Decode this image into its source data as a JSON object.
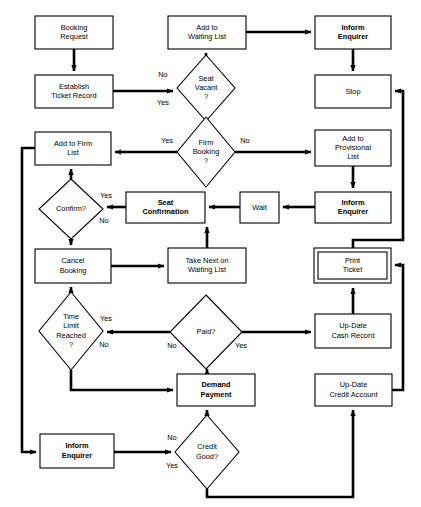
{
  "diagram": {
    "colors": {
      "stroke": "#000000",
      "fill": "#ffffff",
      "text": "#000000"
    },
    "nodes": [
      {
        "id": "booking-request",
        "shape": "process",
        "bold": false,
        "lines": [
          "Booking",
          "Request"
        ],
        "x": 35,
        "y": 16,
        "w": 78,
        "h": 33
      },
      {
        "id": "establish-ticket",
        "shape": "process",
        "bold": false,
        "lines": [
          "Establish",
          "Ticket Record"
        ],
        "x": 35,
        "y": 75,
        "w": 78,
        "h": 33
      },
      {
        "id": "add-waiting-list",
        "shape": "process",
        "bold": false,
        "lines": [
          "Add to",
          "Waiting List"
        ],
        "x": 168,
        "y": 16,
        "w": 78,
        "h": 33
      },
      {
        "id": "inform-enquirer-top",
        "shape": "process",
        "bold": true,
        "lines": [
          "Inform",
          "Enquirer"
        ],
        "x": 315,
        "y": 16,
        "w": 76,
        "h": 33
      },
      {
        "id": "stop",
        "shape": "process",
        "bold": false,
        "lines": [
          "Stop"
        ],
        "x": 315,
        "y": 75,
        "w": 76,
        "h": 33
      },
      {
        "id": "seat-vacant",
        "shape": "decision",
        "bold": false,
        "lines": [
          "Seat",
          "Vacant",
          "?"
        ],
        "cx": 206,
        "cy": 88,
        "rx": 29,
        "ry": 33
      },
      {
        "id": "firm-booking",
        "shape": "decision",
        "bold": false,
        "lines": [
          "Firm",
          "Booking",
          "?"
        ],
        "cx": 206,
        "cy": 152,
        "rx": 29,
        "ry": 35
      },
      {
        "id": "add-firm-list",
        "shape": "process",
        "bold": false,
        "lines": [
          "Add to Firm",
          "List"
        ],
        "x": 35,
        "y": 132,
        "w": 76,
        "h": 33
      },
      {
        "id": "add-provisional-list",
        "shape": "process",
        "bold": false,
        "lines": [
          "Add to",
          "Provisional",
          "List"
        ],
        "x": 315,
        "y": 130,
        "w": 76,
        "h": 36
      },
      {
        "id": "confirm",
        "shape": "decision",
        "bold": false,
        "lines": [
          "Confirm?"
        ],
        "cx": 71,
        "cy": 209,
        "rx": 32,
        "ry": 30
      },
      {
        "id": "seat-confirmation",
        "shape": "process",
        "bold": true,
        "lines": [
          "Seat",
          "Confirmation"
        ],
        "x": 126,
        "y": 192,
        "w": 79,
        "h": 31
      },
      {
        "id": "wait",
        "shape": "process",
        "bold": false,
        "lines": [
          "Wait"
        ],
        "x": 240,
        "y": 192,
        "w": 39,
        "h": 31
      },
      {
        "id": "inform-enquirer-mid",
        "shape": "process",
        "bold": true,
        "lines": [
          "Inform",
          "Enquirer"
        ],
        "x": 315,
        "y": 192,
        "w": 76,
        "h": 31
      },
      {
        "id": "cancel-booking",
        "shape": "process",
        "bold": false,
        "lines": [
          "Cancel",
          "Booking"
        ],
        "x": 35,
        "y": 249,
        "w": 76,
        "h": 34
      },
      {
        "id": "take-next-waiting",
        "shape": "process",
        "bold": false,
        "lines": [
          "Take Next on",
          "Waiting List"
        ],
        "x": 168,
        "y": 248,
        "w": 78,
        "h": 35
      },
      {
        "id": "print-ticket",
        "shape": "subroutine",
        "bold": false,
        "lines": [
          "Print",
          "Ticket"
        ],
        "x": 314,
        "y": 248,
        "w": 77,
        "h": 35
      },
      {
        "id": "time-limit-reached",
        "shape": "decision",
        "bold": false,
        "lines": [
          "Time",
          "Limit",
          "Reached",
          "?"
        ],
        "cx": 71,
        "cy": 331,
        "rx": 32,
        "ry": 39
      },
      {
        "id": "paid",
        "shape": "decision",
        "bold": false,
        "lines": [
          "Paid?"
        ],
        "cx": 206,
        "cy": 332,
        "rx": 36,
        "ry": 37
      },
      {
        "id": "update-cash-record",
        "shape": "process",
        "bold": false,
        "lines": [
          "Up-Date",
          "Cash Record"
        ],
        "x": 315,
        "y": 314,
        "w": 76,
        "h": 34
      },
      {
        "id": "demand-payment",
        "shape": "process",
        "bold": true,
        "lines": [
          "Demand",
          "Payment"
        ],
        "x": 177,
        "y": 374,
        "w": 78,
        "h": 32
      },
      {
        "id": "update-credit-account",
        "shape": "process",
        "bold": false,
        "lines": [
          "Up-Date",
          "Credit Account"
        ],
        "x": 315,
        "y": 374,
        "w": 77,
        "h": 32
      },
      {
        "id": "inform-enquirer-bot",
        "shape": "process",
        "bold": true,
        "lines": [
          "Inform",
          "Enquirer"
        ],
        "x": 40,
        "y": 434,
        "w": 74,
        "h": 34
      },
      {
        "id": "credit-good",
        "shape": "decision",
        "bold": false,
        "lines": [
          "Credit",
          "Good?"
        ],
        "cx": 207,
        "cy": 452,
        "rx": 32,
        "ry": 37
      }
    ],
    "edges": [
      {
        "id": "booking-to-establish",
        "from": "booking-request",
        "to": "establish-ticket",
        "points": "74,49 74,71",
        "arrow": "down"
      },
      {
        "id": "establish-to-seatvacant",
        "from": "establish-ticket",
        "to": "seat-vacant",
        "points": "113,91 173,91",
        "arrow": "right"
      },
      {
        "id": "seatvacant-no-to-waiting",
        "from": "seat-vacant",
        "to": "add-waiting-list",
        "points": "206,55 206,53",
        "arrow": "up"
      },
      {
        "id": "waiting-to-inform-top",
        "from": "add-waiting-list",
        "to": "inform-enquirer-top",
        "points": "246,32 311,32",
        "arrow": "right"
      },
      {
        "id": "inform-top-to-stop",
        "from": "inform-enquirer-top",
        "to": "stop",
        "points": "353,49 353,71",
        "arrow": "down"
      },
      {
        "id": "seatvacant-yes-to-firm",
        "from": "seat-vacant",
        "to": "firm-booking",
        "points": "206,121 206,117",
        "arrow": "down"
      },
      {
        "id": "firm-yes-to-firmlist",
        "from": "firm-booking",
        "to": "add-firm-list",
        "points": "177,152 115,152",
        "arrow": "left"
      },
      {
        "id": "firm-no-to-provisional",
        "from": "firm-booking",
        "to": "add-provisional-list",
        "points": "235,152 311,152",
        "arrow": "right"
      },
      {
        "id": "provisional-to-inform-mid",
        "from": "add-provisional-list",
        "to": "inform-enquirer-mid",
        "points": "353,166 353,188",
        "arrow": "down"
      },
      {
        "id": "inform-mid-to-wait",
        "from": "inform-enquirer-mid",
        "to": "wait",
        "points": "315,207 283,207",
        "arrow": "left"
      },
      {
        "id": "wait-to-seatconfirm",
        "from": "wait",
        "to": "seat-confirmation",
        "points": "240,207 209,207",
        "arrow": "left"
      },
      {
        "id": "seatconfirm-to-confirm",
        "from": "seat-confirmation",
        "to": "confirm",
        "points": "126,207 107,207",
        "arrow": "left"
      },
      {
        "id": "confirm-yes-to-firmlist",
        "from": "confirm",
        "to": "add-firm-list",
        "points": "71,179 71,169",
        "arrow": "up"
      },
      {
        "id": "confirm-no-to-cancel",
        "from": "confirm",
        "to": "cancel-booking",
        "points": "71,239 71,245",
        "arrow": "down"
      },
      {
        "id": "cancel-to-takenext",
        "from": "cancel-booking",
        "to": "take-next-waiting",
        "points": "111,266 164,266",
        "arrow": "right"
      },
      {
        "id": "takenext-to-seatconfirm",
        "from": "take-next-waiting",
        "to": "seat-confirmation",
        "points": "207,248 207,227",
        "arrow": "up"
      },
      {
        "id": "timelimit-yes-to-cancel",
        "from": "time-limit-reached",
        "to": "cancel-booking",
        "points": "71,292 71,287",
        "arrow": "up"
      },
      {
        "id": "paid-no-to-timelimit",
        "from": "paid",
        "to": "time-limit-reached",
        "points": "170,332 107,332",
        "arrow": "left"
      },
      {
        "id": "paid-yes-to-cash",
        "from": "paid",
        "to": "update-cash-record",
        "points": "242,332 311,332",
        "arrow": "right"
      },
      {
        "id": "cash-to-print",
        "from": "update-cash-record",
        "to": "print-ticket",
        "points": "353,314 353,288",
        "arrow": "up"
      },
      {
        "id": "print-to-stop",
        "from": "print-ticket",
        "to": "stop",
        "points": "353,248 353,240 403,240 403,91 395,91",
        "arrow": "right-end"
      },
      {
        "id": "timelimit-no-to-demand",
        "from": "time-limit-reached",
        "to": "demand-payment",
        "points": "71,370 71,390 173,390",
        "arrow": "right"
      },
      {
        "id": "demand-to-paid",
        "from": "demand-payment",
        "to": "paid",
        "points": "207,374 207,369",
        "arrow": "up"
      },
      {
        "id": "creditgood-no-to-demand",
        "from": "credit-good",
        "to": "demand-payment",
        "points": "207,415 207,410",
        "arrow": "up"
      },
      {
        "id": "inform-bot-to-creditgood",
        "from": "inform-enquirer-bot",
        "to": "credit-good",
        "points": "114,452 171,452",
        "arrow": "right"
      },
      {
        "id": "creditgood-yes-to-credit",
        "from": "credit-good",
        "to": "update-credit-account",
        "points": "207,489 207,497 353,497 353,410",
        "arrow": "up"
      },
      {
        "id": "credit-to-print",
        "from": "update-credit-account",
        "to": "print-ticket",
        "points": "392,390 403,390 403,265 395,265",
        "arrow": "right-end"
      },
      {
        "id": "firmlist-to-inform-bot",
        "from": "add-firm-list",
        "to": "inform-enquirer-bot",
        "points": "35,148 22,148 22,452 36,452",
        "arrow": "right"
      }
    ],
    "edge_labels": [
      {
        "id": "label-seatvacant-no",
        "text": "No",
        "x": 163,
        "y": 75
      },
      {
        "id": "label-seatvacant-yes",
        "text": "Yes",
        "x": 163,
        "y": 103
      },
      {
        "id": "label-firm-yes",
        "text": "Yes",
        "x": 167,
        "y": 141
      },
      {
        "id": "label-firm-no",
        "text": "No",
        "x": 245,
        "y": 141
      },
      {
        "id": "label-confirm-yes",
        "text": "Yes",
        "x": 106,
        "y": 196
      },
      {
        "id": "label-confirm-no",
        "text": "No",
        "x": 104,
        "y": 221
      },
      {
        "id": "label-timelimit-yes",
        "text": "Yes",
        "x": 106,
        "y": 319
      },
      {
        "id": "label-timelimit-no",
        "text": "No",
        "x": 104,
        "y": 345
      },
      {
        "id": "label-paid-no",
        "text": "No",
        "x": 172,
        "y": 346
      },
      {
        "id": "label-paid-yes",
        "text": "Yes",
        "x": 241,
        "y": 346
      },
      {
        "id": "label-creditgood-no",
        "text": "No",
        "x": 172,
        "y": 438
      },
      {
        "id": "label-creditgood-yes",
        "text": "Yes",
        "x": 172,
        "y": 466
      }
    ]
  }
}
